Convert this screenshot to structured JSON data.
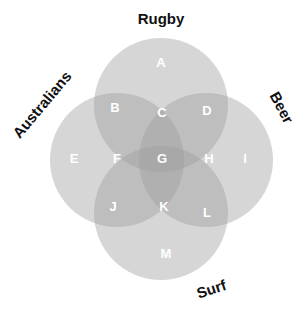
{
  "diagram": {
    "type": "venn-4-set",
    "sets": [
      {
        "id": "rugby",
        "label": "Rugby"
      },
      {
        "id": "australians",
        "label": "Australians"
      },
      {
        "id": "beer",
        "label": "Beer"
      },
      {
        "id": "surf",
        "label": "Surf"
      }
    ],
    "regions": [
      {
        "label": "A",
        "sets": [
          "rugby"
        ]
      },
      {
        "label": "B",
        "sets": [
          "rugby",
          "australians"
        ]
      },
      {
        "label": "C",
        "sets": [
          "rugby",
          "australians",
          "beer"
        ]
      },
      {
        "label": "D",
        "sets": [
          "rugby",
          "beer"
        ]
      },
      {
        "label": "E",
        "sets": [
          "australians"
        ]
      },
      {
        "label": "F",
        "sets": [
          "australians",
          "rugby",
          "surf"
        ]
      },
      {
        "label": "G",
        "sets": [
          "rugby",
          "australians",
          "beer",
          "surf"
        ]
      },
      {
        "label": "H",
        "sets": [
          "beer",
          "rugby",
          "surf"
        ]
      },
      {
        "label": "I",
        "sets": [
          "beer"
        ]
      },
      {
        "label": "J",
        "sets": [
          "australians",
          "surf"
        ]
      },
      {
        "label": "K",
        "sets": [
          "australians",
          "beer",
          "surf"
        ]
      },
      {
        "label": "L",
        "sets": [
          "beer",
          "surf"
        ]
      },
      {
        "label": "M",
        "sets": [
          "surf"
        ]
      }
    ],
    "colors": {
      "circle_fill": "#a8a8a8",
      "label_text": "#111111",
      "region_text": "#ffffff",
      "background": "#ffffff"
    }
  }
}
